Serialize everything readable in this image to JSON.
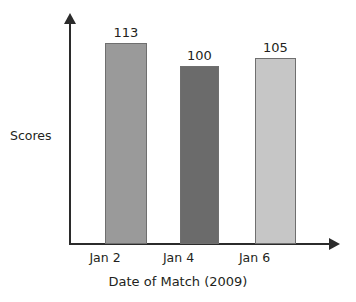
{
  "chart_data": {
    "type": "bar",
    "title": "",
    "subtitle": "",
    "xlabel": "Date of Match (2009)",
    "ylabel": "Scores",
    "categories": [
      "Jan 2",
      "Jan 4",
      "Jan 6"
    ],
    "values": [
      113,
      100,
      105
    ],
    "value_labels": [
      "113",
      "100",
      "105"
    ],
    "bar_colors": [
      "#9a9a9a",
      "#6b6b6b",
      "#c6c6c6"
    ],
    "bar_border_color": "#6f6f6f",
    "axis_color": "#2b2b2b",
    "text_color": "#231f20",
    "background": "#ffffff",
    "ylim": [
      0,
      125
    ],
    "grid": false,
    "legend": null,
    "axis_ticks": []
  },
  "axes": {
    "y_axis_name": "y-axis",
    "x_axis_name": "x-axis"
  }
}
